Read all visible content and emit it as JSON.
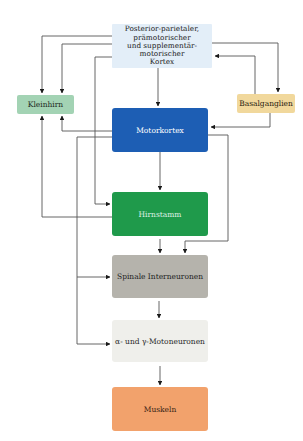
{
  "diagram": {
    "type": "flowchart",
    "title": "",
    "nodes": {
      "top": {
        "label_lines": [
          "Posterior-parietaler,",
          "prämotorischer",
          "und supplementär-",
          "motorischer",
          "Kortex"
        ],
        "color": "#e3eef8"
      },
      "kleinhirn": {
        "label": "Kleinhirn",
        "color": "#a3d3b4"
      },
      "basalganglien": {
        "label": "Basalganglien",
        "color": "#f1d89c"
      },
      "motorkortex": {
        "label": "Motorkortex",
        "color": "#1d5eb4"
      },
      "hirnstamm": {
        "label": "Hirnstamm",
        "color": "#1f9a4b"
      },
      "spinale": {
        "label": "Spinale Interneuronen",
        "color": "#b5b3ac"
      },
      "motoneuronen": {
        "label": "α- und γ-Motoneuronen",
        "color": "#efefeb"
      },
      "muskeln": {
        "label": "Muskeln",
        "color": "#f2a26c"
      }
    },
    "edges": [
      {
        "from": "Posterior-parietaler, prämotorischer und supplementär-motorischer Kortex",
        "to": "Kleinhirn"
      },
      {
        "from": "Posterior-parietaler, prämotorischer und supplementär-motorischer Kortex",
        "to": "Kleinhirn (2)"
      },
      {
        "from": "Posterior-parietaler, prämotorischer und supplementär-motorischer Kortex",
        "to": "Hirnstamm"
      },
      {
        "from": "Posterior-parietaler, prämotorischer und supplementär-motorischer Kortex",
        "to": "Motorkortex"
      },
      {
        "from": "Posterior-parietaler, prämotorischer und supplementär-motorischer Kortex",
        "to": "Basalganglien"
      },
      {
        "from": "Basalganglien",
        "to": "Posterior-parietaler, prämotorischer und supplementär-motorischer Kortex"
      },
      {
        "from": "Basalganglien",
        "to": "Motorkortex"
      },
      {
        "from": "Motorkortex",
        "to": "Kleinhirn"
      },
      {
        "from": "Motorkortex",
        "to": "Hirnstamm"
      },
      {
        "from": "Motorkortex",
        "to": "Spinale Interneuronen"
      },
      {
        "from": "Motorkortex",
        "to": "α- und γ-Motoneuronen"
      },
      {
        "from": "Motorkortex",
        "to": "Spinale Interneuronen (via right)"
      },
      {
        "from": "Hirnstamm",
        "to": "Kleinhirn"
      },
      {
        "from": "Hirnstamm",
        "to": "Spinale Interneuronen"
      },
      {
        "from": "Spinale Interneuronen",
        "to": "α- und γ-Motoneuronen"
      },
      {
        "from": "α- und γ-Motoneuronen",
        "to": "Muskeln"
      }
    ],
    "line_color": "#3a3a3a"
  }
}
